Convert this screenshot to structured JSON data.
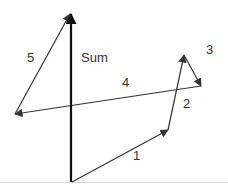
{
  "diagram": {
    "title": "",
    "type": "vector-addition",
    "colors": {
      "vector": "#333333",
      "sum": "#111111",
      "baseline": "#d9d9d9",
      "label": "#333333"
    },
    "vectors": [
      {
        "id": "1",
        "label": "1",
        "from": [
          72,
          182
        ],
        "to": [
          168,
          130
        ],
        "label_pos": [
          133,
          149
        ]
      },
      {
        "id": "2",
        "label": "2",
        "from": [
          168,
          130
        ],
        "to": [
          184,
          55
        ],
        "label_pos": [
          183,
          97
        ]
      },
      {
        "id": "3",
        "label": "3",
        "from": [
          184,
          55
        ],
        "to": [
          201,
          86
        ],
        "label_pos": [
          206,
          43
        ]
      },
      {
        "id": "4",
        "label": "4",
        "from": [
          201,
          86
        ],
        "to": [
          15,
          114
        ],
        "label_pos": [
          122,
          76
        ]
      },
      {
        "id": "5",
        "label": "5",
        "from": [
          15,
          114
        ],
        "to": [
          70,
          14
        ],
        "label_pos": [
          27,
          51
        ]
      },
      {
        "id": "sum",
        "label": "Sum",
        "from": [
          71,
          182
        ],
        "to": [
          71,
          14
        ],
        "label_pos": [
          81,
          51
        ]
      }
    ],
    "baseline": {
      "y": 182
    }
  }
}
